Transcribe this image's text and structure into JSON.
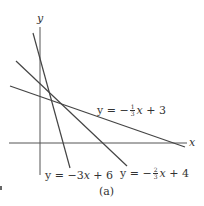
{
  "figure": {
    "caption": "(a)",
    "axes": {
      "x_label": "x",
      "y_label": "y"
    },
    "lines": [
      {
        "id": "line1",
        "equation": "y = -3x + 6",
        "prefix": "y = −3",
        "var": "x",
        "suffix": " + 6"
      },
      {
        "id": "line2",
        "equation": "y = -2/3x + 4",
        "prefix": "y = −",
        "num": "2",
        "den": "3",
        "var": "x",
        "suffix": " + 4"
      },
      {
        "id": "line3",
        "equation": "y = -1/3x + 3",
        "prefix": "y = −",
        "num": "1",
        "den": "3",
        "var": "x",
        "suffix": " + 3"
      }
    ],
    "colors": {
      "line": "#444444",
      "axis": "#555555",
      "text": "#333333"
    }
  }
}
